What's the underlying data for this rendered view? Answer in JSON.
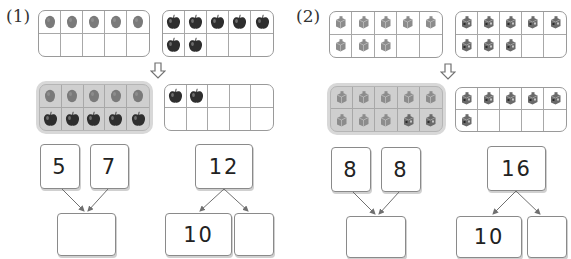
{
  "problems": [
    {
      "label": "(1)",
      "top_frames": [
        {
          "item": "stone",
          "count": 5,
          "cells": [
            "stone",
            "stone",
            "stone",
            "stone",
            "stone",
            "",
            "",
            "",
            "",
            ""
          ]
        },
        {
          "item": "apple",
          "count": 7,
          "cells": [
            "apple",
            "apple",
            "apple",
            "apple",
            "apple",
            "apple",
            "apple",
            "",
            "",
            ""
          ]
        }
      ],
      "arrow": "down-arrow",
      "bottom_frames": [
        {
          "shaded": true,
          "count": 10,
          "cells": [
            "stone",
            "stone",
            "stone",
            "stone",
            "stone",
            "apple",
            "apple",
            "apple",
            "apple",
            "apple"
          ]
        },
        {
          "shaded": false,
          "count": 2,
          "cells": [
            "apple",
            "apple",
            "",
            "",
            "",
            "",
            "",
            "",
            "",
            ""
          ]
        }
      ],
      "addends": [
        "5",
        "7"
      ],
      "sum_answer": "",
      "whole": "12",
      "split_parts": [
        "10",
        ""
      ]
    },
    {
      "label": "(2)",
      "top_frames": [
        {
          "item": "cube-light",
          "count": 8,
          "cells": [
            "cube-light",
            "cube-light",
            "cube-light",
            "cube-light",
            "cube-light",
            "cube-light",
            "cube-light",
            "cube-light",
            "",
            ""
          ]
        },
        {
          "item": "cube-dark",
          "count": 8,
          "cells": [
            "cube-dark",
            "cube-dark",
            "cube-dark",
            "cube-dark",
            "cube-dark",
            "cube-dark",
            "cube-dark",
            "cube-dark",
            "",
            ""
          ]
        }
      ],
      "arrow": "down-arrow",
      "bottom_frames": [
        {
          "shaded": true,
          "count": 10,
          "cells": [
            "cube-light",
            "cube-light",
            "cube-light",
            "cube-light",
            "cube-light",
            "cube-light",
            "cube-light",
            "cube-light",
            "cube-dark",
            "cube-dark"
          ]
        },
        {
          "shaded": false,
          "count": 6,
          "cells": [
            "cube-dark",
            "cube-dark",
            "cube-dark",
            "cube-dark",
            "cube-dark",
            "cube-dark",
            "",
            "",
            "",
            ""
          ]
        }
      ],
      "addends": [
        "8",
        "8"
      ],
      "sum_answer": "",
      "whole": "16",
      "split_parts": [
        "10",
        ""
      ]
    }
  ],
  "colors": {
    "frame_border": "#9a9a9a",
    "shaded_fill": "#cfcfcf",
    "stone": "#7a7a7a",
    "apple": "#2e2e2e",
    "cube_light": "#8c8c8c",
    "cube_dark": "#6a6a6a",
    "arrow_line": "#707070"
  }
}
